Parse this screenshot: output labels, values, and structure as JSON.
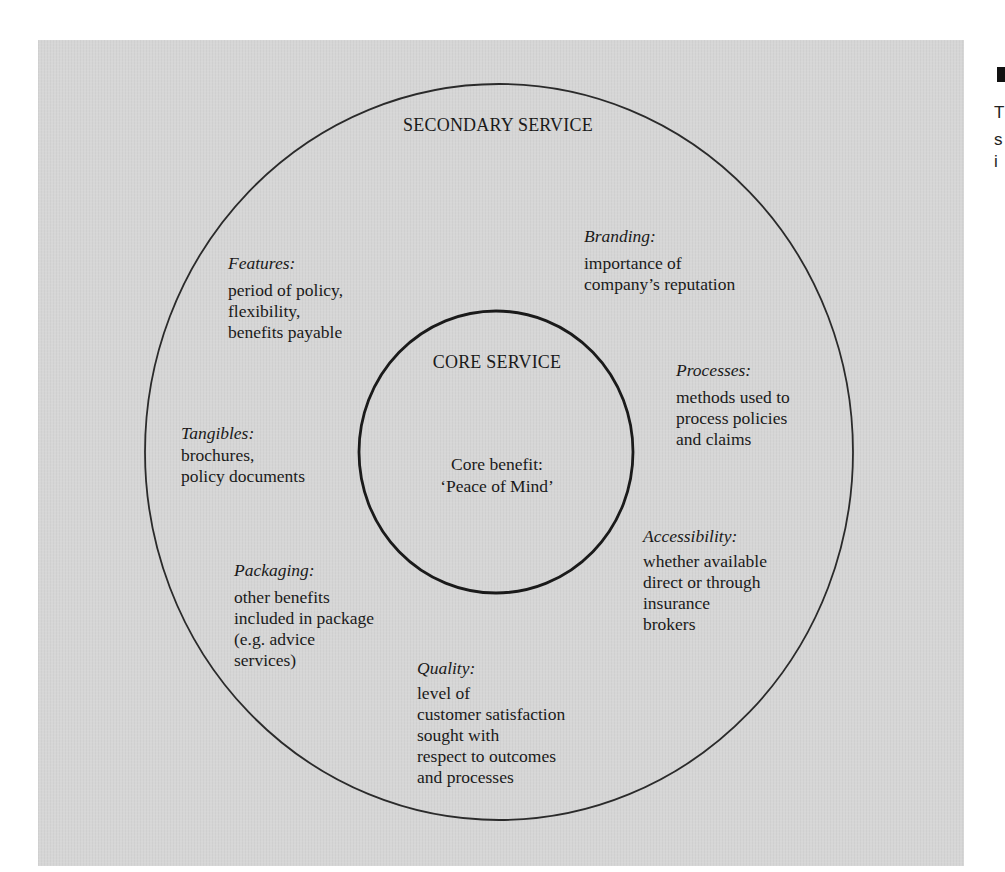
{
  "diagram": {
    "outer_ring": {
      "title": "SECONDARY SERVICE",
      "cx": 499,
      "cy": 452,
      "rx": 354,
      "ry": 368,
      "stroke": "#2a2a2a"
    },
    "inner_ring": {
      "title": "CORE SERVICE",
      "cx": 496,
      "cy": 452,
      "rx": 137,
      "ry": 141,
      "stroke": "#1a1a1a",
      "benefit_label": "Core benefit:",
      "benefit_value": "‘Peace of Mind’"
    },
    "background_color": "#d6d6d6",
    "elements": [
      {
        "heading": "Features:",
        "lines": [
          "period of policy,",
          "flexibility,",
          "benefits payable"
        ]
      },
      {
        "heading": "Branding:",
        "lines": [
          "importance of",
          "company’s reputation"
        ]
      },
      {
        "heading": "Processes:",
        "lines": [
          "methods used to",
          "process policies",
          "and claims"
        ]
      },
      {
        "heading": "Tangibles:",
        "lines": [
          "brochures,",
          "policy documents"
        ]
      },
      {
        "heading": "Accessibility:",
        "lines": [
          "whether available",
          "direct or through",
          "insurance",
          "brokers"
        ]
      },
      {
        "heading": "Packaging:",
        "lines": [
          "other benefits",
          "included in package",
          "(e.g. advice",
          "services)"
        ]
      },
      {
        "heading": "Quality:",
        "lines": [
          "level of",
          "customer satisfaction",
          "sought with",
          "respect to outcomes",
          "and processes"
        ]
      }
    ]
  },
  "edge_text": {
    "chars": [
      "T",
      "s",
      "i"
    ]
  }
}
